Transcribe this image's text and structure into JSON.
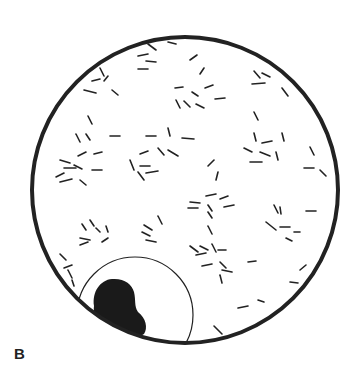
{
  "figure": {
    "panel_label": "B",
    "colors": {
      "stroke": "#222222",
      "background": "#ffffff",
      "nucleus": "#1a1a1a"
    },
    "field": {
      "cx": 185,
      "cy": 190,
      "r": 153,
      "stroke_width": 4
    },
    "cell": {
      "cx": 135,
      "cy": 315,
      "r": 58,
      "stroke_width": 1.2
    },
    "nucleus_path": "M94,306 C92,292 100,280 112,279 C124,278 132,284 134,292 C136,300 134,306 138,312 C146,318 148,328 144,334 C138,338 128,336 116,332 C104,326 92,318 94,306 Z",
    "rods": [
      [
        148,
        44,
        156,
        50
      ],
      [
        168,
        42,
        176,
        44
      ],
      [
        138,
        56,
        148,
        54
      ],
      [
        146,
        61,
        156,
        62
      ],
      [
        138,
        69,
        148,
        69
      ],
      [
        190,
        60,
        197,
        55
      ],
      [
        200,
        74,
        204,
        68
      ],
      [
        175,
        88,
        183,
        87
      ],
      [
        192,
        92,
        198,
        96
      ],
      [
        205,
        88,
        213,
        85
      ],
      [
        215,
        99,
        225,
        98
      ],
      [
        176,
        100,
        180,
        108
      ],
      [
        184,
        101,
        190,
        107
      ],
      [
        196,
        104,
        204,
        108
      ],
      [
        254,
        71,
        260,
        78
      ],
      [
        262,
        73,
        270,
        77
      ],
      [
        252,
        84,
        265,
        83
      ],
      [
        282,
        88,
        288,
        96
      ],
      [
        100,
        68,
        104,
        76
      ],
      [
        92,
        81,
        100,
        79
      ],
      [
        104,
        81,
        108,
        76
      ],
      [
        84,
        90,
        96,
        93
      ],
      [
        112,
        90,
        118,
        95
      ],
      [
        88,
        116,
        92,
        124
      ],
      [
        76,
        134,
        80,
        142
      ],
      [
        86,
        134,
        90,
        140
      ],
      [
        110,
        136,
        120,
        136
      ],
      [
        146,
        136,
        156,
        136
      ],
      [
        168,
        128,
        170,
        136
      ],
      [
        182,
        138,
        194,
        139
      ],
      [
        140,
        154,
        148,
        151
      ],
      [
        158,
        148,
        164,
        155
      ],
      [
        168,
        150,
        178,
        156
      ],
      [
        130,
        160,
        134,
        170
      ],
      [
        140,
        166,
        150,
        166
      ],
      [
        146,
        173,
        158,
        171
      ],
      [
        138,
        172,
        144,
        180
      ],
      [
        60,
        160,
        70,
        163
      ],
      [
        64,
        168,
        76,
        168
      ],
      [
        56,
        177,
        64,
        173
      ],
      [
        60,
        182,
        72,
        179
      ],
      [
        74,
        165,
        82,
        169
      ],
      [
        78,
        156,
        86,
        152
      ],
      [
        94,
        154,
        102,
        152
      ],
      [
        92,
        170,
        102,
        170
      ],
      [
        80,
        180,
        86,
        185
      ],
      [
        208,
        166,
        214,
        160
      ],
      [
        218,
        172,
        216,
        180
      ],
      [
        254,
        112,
        258,
        120
      ],
      [
        254,
        133,
        256,
        141
      ],
      [
        262,
        143,
        272,
        141
      ],
      [
        282,
        133,
        284,
        141
      ],
      [
        244,
        148,
        252,
        152
      ],
      [
        260,
        152,
        270,
        156
      ],
      [
        276,
        152,
        278,
        160
      ],
      [
        250,
        162,
        262,
        162
      ],
      [
        310,
        147,
        314,
        155
      ],
      [
        304,
        168,
        314,
        168
      ],
      [
        320,
        170,
        326,
        176
      ],
      [
        190,
        202,
        200,
        203
      ],
      [
        188,
        208,
        198,
        208
      ],
      [
        206,
        196,
        216,
        194
      ],
      [
        208,
        205,
        212,
        211
      ],
      [
        220,
        199,
        228,
        196
      ],
      [
        224,
        207,
        234,
        205
      ],
      [
        208,
        212,
        212,
        218
      ],
      [
        208,
        226,
        212,
        234
      ],
      [
        274,
        205,
        278,
        213
      ],
      [
        280,
        207,
        281,
        214
      ],
      [
        266,
        222,
        276,
        230
      ],
      [
        280,
        227,
        290,
        227
      ],
      [
        294,
        232,
        300,
        232
      ],
      [
        286,
        238,
        292,
        241
      ],
      [
        306,
        211,
        316,
        211
      ],
      [
        82,
        224,
        86,
        230
      ],
      [
        90,
        220,
        94,
        226
      ],
      [
        96,
        228,
        100,
        232
      ],
      [
        106,
        226,
        108,
        232
      ],
      [
        80,
        238,
        90,
        240
      ],
      [
        80,
        245,
        88,
        242
      ],
      [
        102,
        242,
        108,
        238
      ],
      [
        158,
        216,
        162,
        224
      ],
      [
        142,
        232,
        150,
        236
      ],
      [
        146,
        240,
        156,
        242
      ],
      [
        144,
        225,
        152,
        230
      ],
      [
        190,
        246,
        198,
        252
      ],
      [
        196,
        255,
        206,
        253
      ],
      [
        200,
        246,
        208,
        250
      ],
      [
        212,
        244,
        216,
        252
      ],
      [
        218,
        250,
        226,
        250
      ],
      [
        202,
        266,
        212,
        264
      ],
      [
        220,
        262,
        226,
        268
      ],
      [
        222,
        270,
        232,
        272
      ],
      [
        220,
        275,
        222,
        283
      ],
      [
        248,
        262,
        256,
        261
      ],
      [
        60,
        254,
        66,
        260
      ],
      [
        64,
        268,
        72,
        265
      ],
      [
        68,
        270,
        72,
        278
      ],
      [
        72,
        280,
        74,
        286
      ],
      [
        300,
        270,
        306,
        265
      ],
      [
        290,
        282,
        298,
        283
      ],
      [
        238,
        308,
        248,
        306
      ],
      [
        258,
        300,
        264,
        302
      ],
      [
        214,
        326,
        222,
        334
      ]
    ]
  }
}
